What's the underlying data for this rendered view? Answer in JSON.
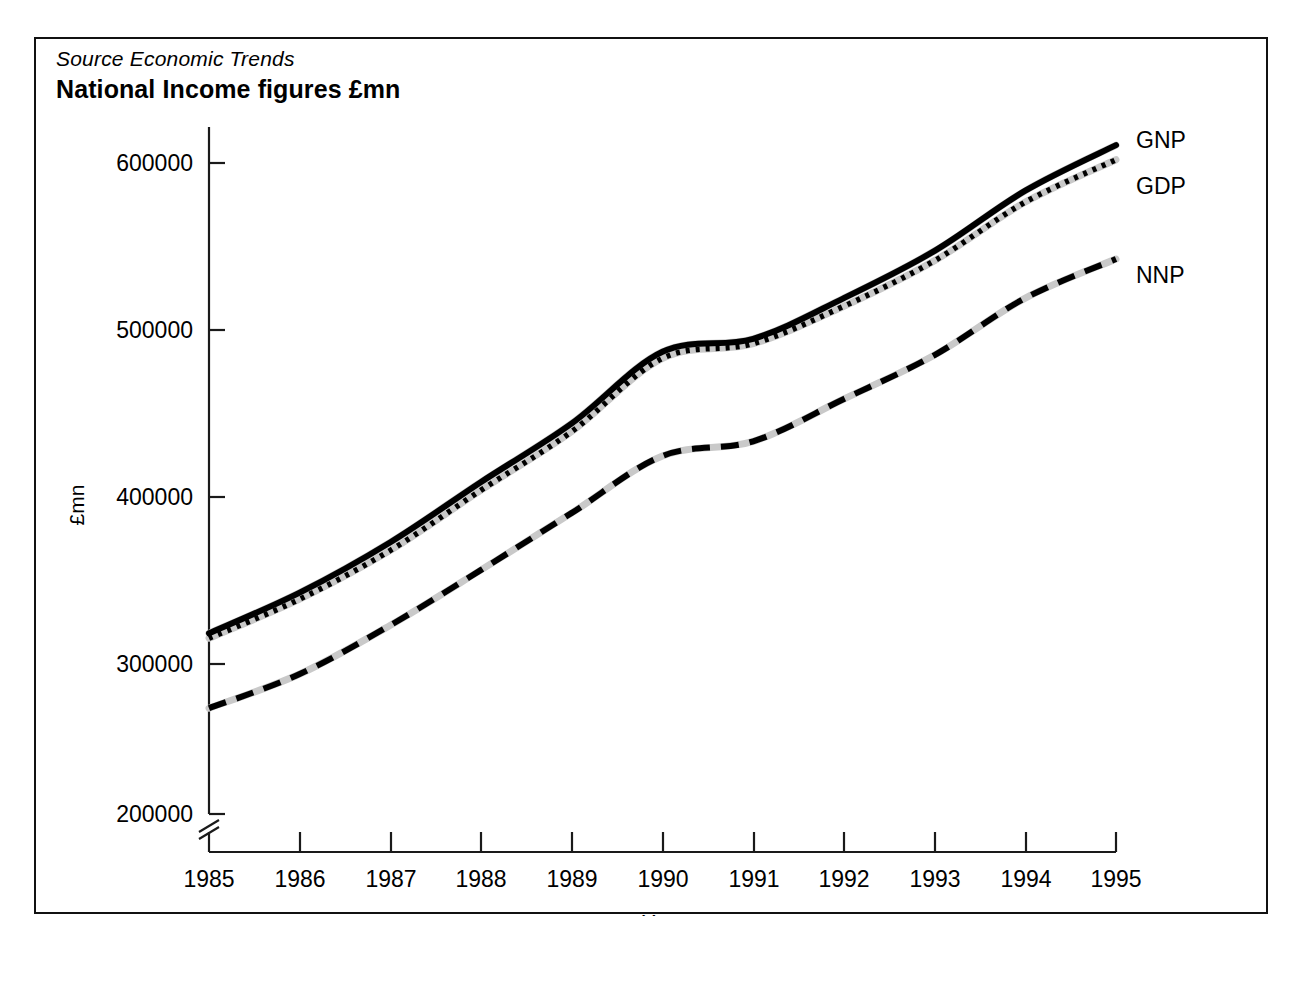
{
  "figure": {
    "source_note": "Source Economic Trends",
    "title": "National Income figures £mn"
  },
  "chart_data": {
    "type": "line",
    "title": "National Income figures £mn",
    "subtitle": "Source Economic Trends",
    "xlabel": "Year",
    "ylabel": "£mn",
    "x": [
      1985,
      1986,
      1987,
      1988,
      1989,
      1990,
      1991,
      1992,
      1993,
      1994,
      1995
    ],
    "xticklabels": [
      "1985",
      "1986",
      "1987",
      "1988",
      "1989",
      "1990",
      "1991",
      "1992",
      "1993",
      "1994",
      "1995"
    ],
    "yticklabels": [
      "200000",
      "300000",
      "400000",
      "500000",
      "600000"
    ],
    "yticks": [
      200000,
      300000,
      400000,
      500000,
      600000
    ],
    "xlim": [
      1985,
      1995
    ],
    "ylim": [
      200000,
      600000
    ],
    "y_axis_break": true,
    "grid": false,
    "legend_position": "right-of-line-ends",
    "series": [
      {
        "name": "GNP",
        "style": "solid",
        "color": "#000000",
        "values": [
          311000,
          336000,
          367000,
          404000,
          440000,
          484000,
          492000,
          517000,
          546000,
          583000,
          611000
        ]
      },
      {
        "name": "GDP",
        "style": "dotted",
        "color": "#000000",
        "values": [
          308000,
          332000,
          362000,
          399000,
          435000,
          480000,
          489000,
          512000,
          540000,
          576000,
          602000
        ]
      },
      {
        "name": "NNP",
        "style": "dashed",
        "color": "#000000",
        "values": [
          265000,
          286000,
          316000,
          350000,
          385000,
          420000,
          429000,
          455000,
          482000,
          517000,
          541000
        ]
      }
    ]
  },
  "axes": {
    "y_title": "£mn",
    "x_title": "Year"
  }
}
